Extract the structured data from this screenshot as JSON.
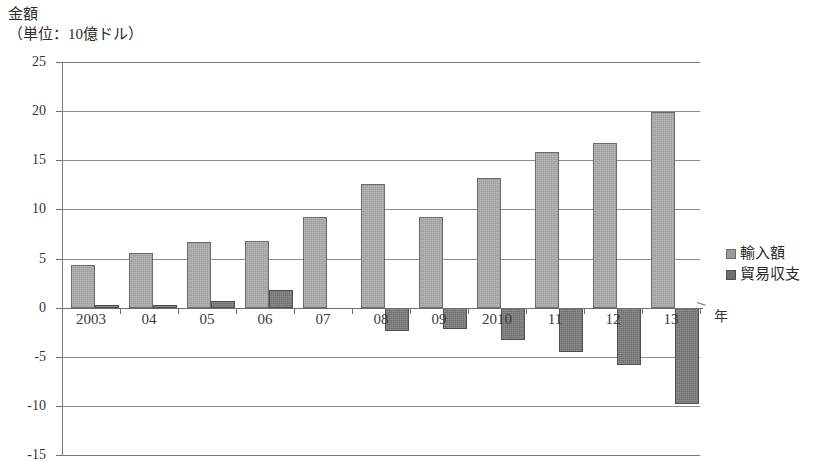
{
  "chart_data": {
    "type": "bar",
    "title": "金額",
    "subtitle": "（単位：10億ドル）",
    "xlabel": "年",
    "ylabel": "",
    "ylim": [
      -15,
      25
    ],
    "ytick_step": 5,
    "yticks": [
      "25",
      "20",
      "15",
      "10",
      "5",
      "0",
      "-5",
      "-10",
      "-15"
    ],
    "grid": true,
    "legend_position": "right",
    "categories": [
      "2003",
      "04",
      "05",
      "06",
      "07",
      "08",
      "09",
      "2010",
      "11",
      "12",
      "13"
    ],
    "series": [
      {
        "name": "輸入額",
        "color": "#9b9b9b",
        "values": [
          4.3,
          5.6,
          6.7,
          6.8,
          9.2,
          12.6,
          9.2,
          13.2,
          15.8,
          16.8,
          19.9
        ]
      },
      {
        "name": "貿易収支",
        "color": "#6e6e6e",
        "values": [
          0.3,
          0.3,
          0.7,
          1.8,
          0.0,
          -2.4,
          -2.2,
          -3.3,
          -4.5,
          -5.8,
          -9.8
        ]
      }
    ]
  },
  "legend": {
    "items": [
      {
        "label": "輸入額",
        "swatch": "import"
      },
      {
        "label": "貿易収支",
        "swatch": "balance"
      }
    ]
  }
}
